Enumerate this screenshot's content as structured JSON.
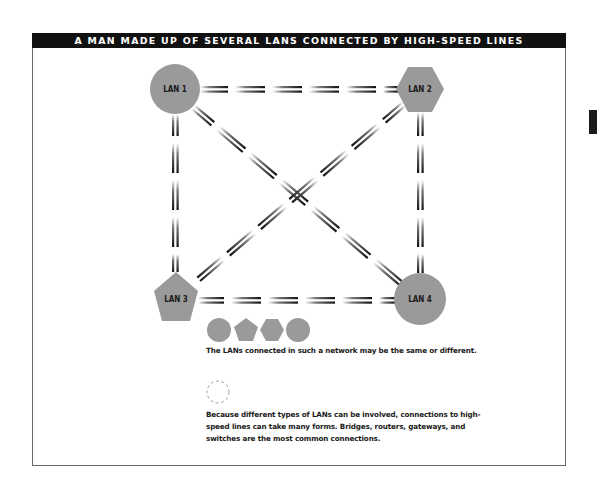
{
  "header": {
    "title": "A MAN MADE UP OF SEVERAL LANS CONNECTED BY HIGH-SPEED LINES"
  },
  "nodes": [
    {
      "id": "lan1",
      "label": "LAN 1",
      "shape": "circle",
      "cx": 175,
      "cy": 89
    },
    {
      "id": "lan2",
      "label": "LAN 2",
      "shape": "hexagon",
      "cx": 420,
      "cy": 89
    },
    {
      "id": "lan3",
      "label": "LAN 3",
      "shape": "pentagon",
      "cx": 176,
      "cy": 297
    },
    {
      "id": "lan4",
      "label": "LAN 4",
      "shape": "circle",
      "cx": 420,
      "cy": 299
    }
  ],
  "connections": [
    {
      "from": "LAN 1",
      "to": "LAN 2",
      "type": "high-speed line"
    },
    {
      "from": "LAN 1",
      "to": "LAN 3",
      "type": "high-speed line"
    },
    {
      "from": "LAN 1",
      "to": "LAN 4",
      "type": "high-speed line"
    },
    {
      "from": "LAN 2",
      "to": "LAN 3",
      "type": "high-speed line"
    },
    {
      "from": "LAN 2",
      "to": "LAN 4",
      "type": "high-speed line"
    },
    {
      "from": "LAN 3",
      "to": "LAN 4",
      "type": "high-speed line"
    }
  ],
  "legend": {
    "shapes": [
      "circle",
      "pentagon",
      "hexagon",
      "circle"
    ],
    "shapes_caption": "The LANs connected in such a network may be the same or different.",
    "connector_icon": "dashed-circle",
    "connector_caption": "Because different types of LANs can be involved, connections to high-speed lines can take many forms. Bridges, routers, gateways, and switches are the most common connections."
  },
  "colors": {
    "header_bg": "#111111",
    "header_text": "#ffffff",
    "node_fill": "#9a9a9a",
    "line_dark": "#1a1a1a",
    "frame_border": "#6a6a6a"
  }
}
